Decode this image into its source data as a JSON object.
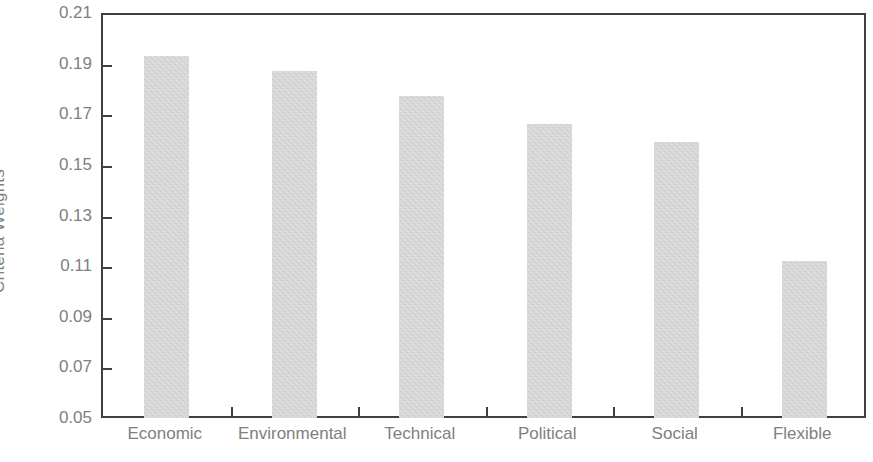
{
  "chart_data": {
    "type": "bar",
    "title": "",
    "subtitle": "",
    "xlabel": "",
    "ylabel": "Criteria Weights",
    "categories": [
      "Economic",
      "Environmental",
      "Technical",
      "Political",
      "Social",
      "Flexible"
    ],
    "values": [
      0.194,
      0.188,
      0.178,
      0.167,
      0.16,
      0.113
    ],
    "ylim": [
      0.05,
      0.21
    ],
    "ytick_values": [
      0.05,
      0.07,
      0.09,
      0.11,
      0.13,
      0.15,
      0.17,
      0.19,
      0.21
    ],
    "ytick_labels": [
      "0.05",
      "0.07",
      "0.09",
      "0.11",
      "0.13",
      "0.15",
      "0.17",
      "0.19",
      "0.21"
    ],
    "grid": false,
    "legend": null,
    "legend_position": "none",
    "series": [
      {
        "name": "Criteria Weights",
        "values": [
          0.194,
          0.188,
          0.178,
          0.167,
          0.16,
          0.113
        ]
      }
    ],
    "colors": {
      "bar_fill": "#c9c9c9",
      "axis": "#404040",
      "tick_label": "#808080",
      "background": "#ffffff"
    }
  }
}
